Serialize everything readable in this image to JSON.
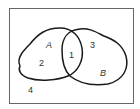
{
  "diagram": {
    "type": "venn",
    "sets": [
      {
        "name": "A",
        "label": "A"
      },
      {
        "name": "B",
        "label": "B"
      }
    ],
    "regions": [
      {
        "id": "intersection",
        "label": "1"
      },
      {
        "id": "a-only",
        "label": "2"
      },
      {
        "id": "b-only",
        "label": "3"
      },
      {
        "id": "outside",
        "label": "4"
      }
    ],
    "colors": {
      "stroke": "#1a1a1a",
      "frame": "#555555",
      "background": "#ffffff"
    }
  }
}
